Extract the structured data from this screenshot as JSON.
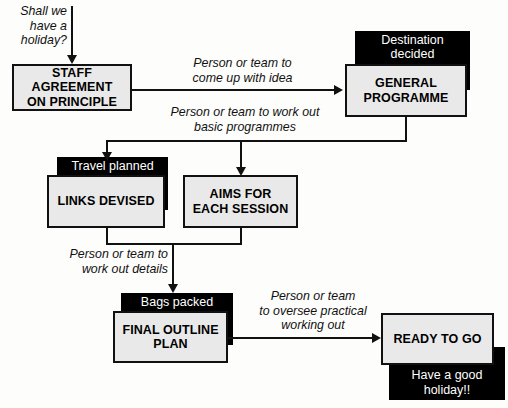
{
  "diagram": {
    "colors": {
      "box_fill": "#e9e9e9",
      "box_border": "#111111",
      "tag_fill": "#000000",
      "tag_text": "#ffffff",
      "line": "#111111",
      "background": "#fdfdfc"
    },
    "nodes": [
      {
        "id": "staff",
        "label": "STAFF AGREEMENT\nON PRINCIPLE"
      },
      {
        "id": "genprog",
        "label": "GENERAL\nPROGRAMME"
      },
      {
        "id": "links",
        "label": "LINKS DEVISED"
      },
      {
        "id": "aims",
        "label": "AIMS FOR\nEACH SESSION"
      },
      {
        "id": "final",
        "label": "FINAL OUTLINE\nPLAN"
      },
      {
        "id": "ready",
        "label": "READY TO GO"
      }
    ],
    "tags": [
      {
        "id": "destination",
        "label": "Destination\ndecided"
      },
      {
        "id": "travel",
        "label": "Travel planned"
      },
      {
        "id": "bags",
        "label": "Bags packed"
      },
      {
        "id": "holiday",
        "label": "Have a good\nholiday!!"
      }
    ],
    "labels": [
      {
        "id": "start",
        "text": "Shall we\nhave a\nholiday?"
      },
      {
        "id": "idea",
        "text": "Person or team to\ncome up with idea"
      },
      {
        "id": "basic",
        "text": "Person or team to work out\nbasic programmes"
      },
      {
        "id": "details",
        "text": "Person or team to\nwork out details"
      },
      {
        "id": "oversee",
        "text": "Person or team\nto oversee practical\nworking out"
      }
    ]
  }
}
